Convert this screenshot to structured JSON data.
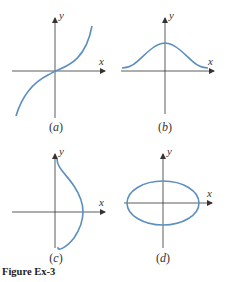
{
  "figure": {
    "caption": "Figure Ex-3",
    "curve_color": "#5b8fc0",
    "axis_color": "#333333",
    "panels": [
      {
        "id": "a",
        "label_open": "(",
        "label_letter": "a",
        "label_close": ")",
        "x_label": "x",
        "y_label": "y",
        "curve": "increasing cubic-like curve through origin"
      },
      {
        "id": "b",
        "label_open": "(",
        "label_letter": "b",
        "label_close": ")",
        "x_label": "x",
        "y_label": "y",
        "curve": "bell-shaped curve above x-axis, peak on y-axis"
      },
      {
        "id": "c",
        "label_open": "(",
        "label_letter": "c",
        "label_close": ")",
        "x_label": "x",
        "y_label": "y",
        "curve": "bell-shaped curve opening along y-axis, bulging toward positive x"
      },
      {
        "id": "d",
        "label_open": "(",
        "label_letter": "d",
        "label_close": ")",
        "x_label": "x",
        "y_label": "y",
        "curve": "horizontal ellipse centered at origin"
      }
    ]
  }
}
